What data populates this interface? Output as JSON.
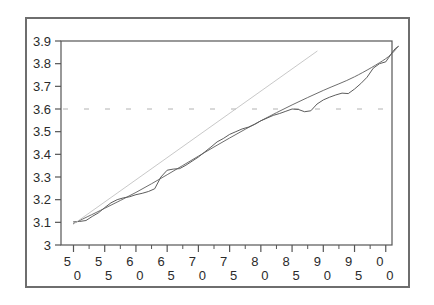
{
  "figure": {
    "background_color": "#ffffff",
    "border_color": "#6e6e6e",
    "plot_frame_color": "#555555"
  },
  "chart_data": {
    "type": "line",
    "title": "",
    "subtitle": "",
    "xlabel": "",
    "ylabel": "",
    "xlim": [
      48,
      101
    ],
    "ylim": [
      3.0,
      3.9
    ],
    "grid": false,
    "legend": null,
    "x_tick_labels": [
      "50",
      "55",
      "60",
      "65",
      "70",
      "75",
      "80",
      "85",
      "90",
      "95",
      "00"
    ],
    "x_tick_values": [
      50,
      55,
      60,
      65,
      70,
      75,
      80,
      85,
      90,
      95,
      100
    ],
    "x_minor_tick_step": 2.5,
    "y_tick_labels": [
      "3",
      "3.1",
      "3.2",
      "3.3",
      "3.4",
      "3.5",
      "3.6",
      "3.7",
      "3.8",
      "3.9"
    ],
    "y_tick_values": [
      3.0,
      3.1,
      3.2,
      3.3,
      3.4,
      3.5,
      3.6,
      3.7,
      3.8,
      3.9
    ],
    "annotations": [
      {
        "name": "reference-line-3.6",
        "type": "hline",
        "y": 3.6,
        "style": "dashed",
        "color": "#9a9a9a",
        "label": ""
      }
    ],
    "series": [
      {
        "name": "observed",
        "style": "solid-jagged",
        "color": "#4a4a4a",
        "width": 0.9,
        "x": [
          50,
          51,
          52,
          53,
          54,
          55,
          56,
          57,
          58,
          59,
          60,
          61,
          62,
          63,
          64,
          65,
          66,
          67,
          68,
          69,
          70,
          71,
          72,
          73,
          74,
          75,
          76,
          77,
          78,
          79,
          80,
          81,
          82,
          83,
          84,
          85,
          86,
          87,
          88,
          89,
          90,
          91,
          92,
          93,
          94,
          95,
          96,
          97,
          98,
          99,
          100
        ],
        "values": [
          3.102,
          3.104,
          3.108,
          3.126,
          3.142,
          3.165,
          3.186,
          3.2,
          3.208,
          3.213,
          3.222,
          3.228,
          3.236,
          3.248,
          3.3,
          3.33,
          3.335,
          3.337,
          3.352,
          3.37,
          3.388,
          3.41,
          3.432,
          3.455,
          3.47,
          3.488,
          3.5,
          3.512,
          3.52,
          3.532,
          3.548,
          3.56,
          3.572,
          3.58,
          3.59,
          3.6,
          3.598,
          3.588,
          3.592,
          3.622,
          3.64,
          3.652,
          3.662,
          3.67,
          3.668,
          3.688,
          3.712,
          3.74,
          3.78,
          3.8,
          3.808
        ],
        "extra_x": [
          100.5,
          101,
          101.5,
          102
        ],
        "extra_values": [
          3.828,
          3.848,
          3.866,
          3.876
        ]
      },
      {
        "name": "smoothed-trend",
        "style": "solid-smooth",
        "color": "#5c5c5c",
        "width": 0.9,
        "x": [
          50,
          55,
          60,
          65,
          70,
          75,
          80,
          85,
          90,
          95,
          100,
          102
        ],
        "values": [
          3.095,
          3.162,
          3.232,
          3.31,
          3.392,
          3.472,
          3.548,
          3.618,
          3.682,
          3.742,
          3.822,
          3.876
        ]
      },
      {
        "name": "linear-trend-extrapolation",
        "style": "solid-light-straight",
        "color": "#c2c2c2",
        "width": 0.9,
        "x": [
          50,
          89
        ],
        "values": [
          3.092,
          3.855
        ]
      }
    ]
  }
}
